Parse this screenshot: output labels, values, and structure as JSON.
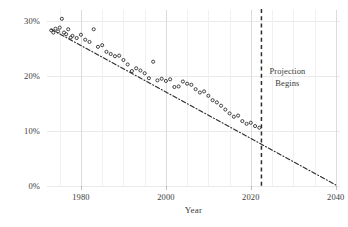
{
  "chart_data": {
    "type": "scatter",
    "title": "",
    "xlabel": "Year",
    "ylabel": "",
    "xlim": [
      1972,
      2041
    ],
    "ylim": [
      0,
      32
    ],
    "grid": true,
    "legend": null,
    "xticks": [
      1980,
      2000,
      2020,
      2040
    ],
    "xtick_labels": [
      "1980",
      "2000",
      "2020",
      "2040"
    ],
    "yticks": [
      0,
      10,
      20,
      30
    ],
    "ytick_labels": [
      "0%",
      "10%",
      "20%",
      "30%"
    ],
    "annotations": [
      {
        "name": "projection-begins",
        "line1": "Projection",
        "line2": "Begins",
        "x": 2022.5,
        "type": "vertical-dashed-line-with-label"
      }
    ],
    "series": [
      {
        "name": "observed-share",
        "type": "scatter",
        "marker": "open-circle",
        "color": "#3a3a3a",
        "points": [
          [
            1973,
            28.3
          ],
          [
            1973.5,
            27.9
          ],
          [
            1974,
            28.6
          ],
          [
            1974.6,
            28.1
          ],
          [
            1975,
            28.8
          ],
          [
            1975.5,
            30.4
          ],
          [
            1976,
            27.9
          ],
          [
            1976.5,
            27.6
          ],
          [
            1977,
            28.5
          ],
          [
            1977.6,
            27.0
          ],
          [
            1978,
            27.3
          ],
          [
            1979,
            26.9
          ],
          [
            1980,
            27.5
          ],
          [
            1981,
            26.6
          ],
          [
            1982,
            26.2
          ],
          [
            1983,
            28.5
          ],
          [
            1984,
            25.3
          ],
          [
            1985,
            25.6
          ],
          [
            1986,
            24.4
          ],
          [
            1987,
            24.0
          ],
          [
            1988,
            23.6
          ],
          [
            1989,
            23.7
          ],
          [
            1990,
            22.9
          ],
          [
            1991,
            22.1
          ],
          [
            1992,
            20.9
          ],
          [
            1993,
            21.4
          ],
          [
            1994,
            21.0
          ],
          [
            1995,
            20.5
          ],
          [
            1996,
            19.6
          ],
          [
            1997,
            22.6
          ],
          [
            1998,
            19.2
          ],
          [
            1999,
            19.5
          ],
          [
            2000,
            19.1
          ],
          [
            2001,
            19.4
          ],
          [
            2002,
            18.0
          ],
          [
            2003,
            18.1
          ],
          [
            2004,
            19.0
          ],
          [
            2005,
            18.6
          ],
          [
            2006,
            18.4
          ],
          [
            2007,
            17.6
          ],
          [
            2008,
            17.0
          ],
          [
            2009,
            17.2
          ],
          [
            2010,
            16.4
          ],
          [
            2011,
            15.6
          ],
          [
            2012,
            15.2
          ],
          [
            2013,
            14.6
          ],
          [
            2014,
            13.9
          ],
          [
            2015,
            13.2
          ],
          [
            2016,
            12.6
          ],
          [
            2017,
            12.8
          ],
          [
            2018,
            11.8
          ],
          [
            2019,
            11.3
          ],
          [
            2020,
            11.5
          ],
          [
            2021,
            10.9
          ],
          [
            2022,
            10.6
          ]
        ]
      },
      {
        "name": "trend-line",
        "type": "line",
        "style": "dash-dot",
        "color": "#2e2e2e",
        "x_start": 1973,
        "y_start": 28.5,
        "x_end": 2040,
        "y_end": 0.2
      }
    ]
  }
}
